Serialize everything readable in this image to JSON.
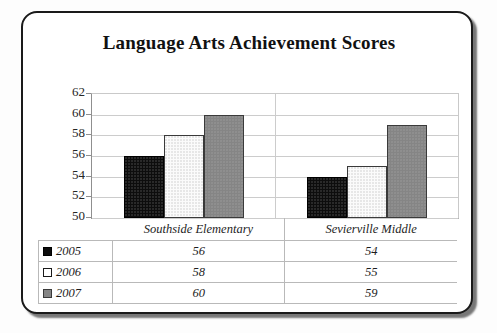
{
  "chart_data": {
    "type": "bar",
    "title": "Language Arts Achievement Scores",
    "xlabel": "",
    "ylabel": "",
    "categories": [
      "Southside Elementary",
      "Sevierville Middle"
    ],
    "series": [
      {
        "name": "2005",
        "values": [
          56,
          54
        ],
        "color": "#0d0d0d",
        "pattern": "dark-dotted"
      },
      {
        "name": "2006",
        "values": [
          58,
          55
        ],
        "color": "#fbfbfb",
        "pattern": "light-dotted"
      },
      {
        "name": "2007",
        "values": [
          60,
          59
        ],
        "color": "#858585",
        "pattern": "gray-dotted"
      }
    ],
    "ylim": [
      50,
      62
    ],
    "yticks": [
      50,
      52,
      54,
      56,
      58,
      60,
      62
    ],
    "ytick_labels": [
      "50",
      "52",
      "54",
      "56",
      "58",
      "60",
      "62"
    ],
    "grid": true,
    "legend_position": "table-left-column",
    "data_table": {
      "column_headers": [
        "",
        "Southside Elementary",
        "Sevierville Middle"
      ],
      "rows": [
        {
          "label": "2005",
          "values": [
            "56",
            "54"
          ]
        },
        {
          "label": "2006",
          "values": [
            "58",
            "55"
          ]
        },
        {
          "label": "2007",
          "values": [
            "60",
            "59"
          ]
        }
      ]
    }
  },
  "frame": {
    "border_color": "#1a1a1a",
    "background": "#ffffff"
  }
}
